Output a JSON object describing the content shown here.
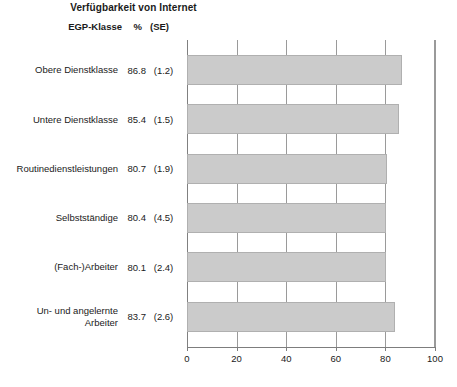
{
  "chart_data": {
    "type": "bar",
    "orientation": "horizontal",
    "title": "Verfügbarkeit von Internet",
    "xlabel": "",
    "ylabel": "",
    "xlim": [
      0,
      100
    ],
    "xticks": [
      0,
      20,
      40,
      60,
      80,
      100
    ],
    "grid": true,
    "legend": false,
    "bar_color": "#cbcbcb",
    "bar_border_color": "#b0b0b0",
    "columns": {
      "category": "EGP-Klasse",
      "percent": "%",
      "stderr": "(SE)"
    },
    "categories": [
      "Obere Dienstklasse",
      "Untere Dienstklasse",
      "Routinedienstleistungen",
      "Selbstständige",
      "(Fach-)Arbeiter",
      "Un- und angelernte\nArbeiter"
    ],
    "values": [
      86.8,
      85.4,
      80.7,
      80.4,
      80.1,
      83.7
    ],
    "standard_errors": [
      1.2,
      1.5,
      1.9,
      4.5,
      2.4,
      2.6
    ],
    "rows": [
      {
        "label": "Obere Dienstklasse",
        "percent": "86.8",
        "se": "(1.2)",
        "value": 86.8
      },
      {
        "label": "Untere Dienstklasse",
        "percent": "85.4",
        "se": "(1.5)",
        "value": 85.4
      },
      {
        "label": "Routinedienstleistungen",
        "percent": "80.7",
        "se": "(1.9)",
        "value": 80.7
      },
      {
        "label": "Selbstständige",
        "percent": "80.4",
        "se": "(4.5)",
        "value": 80.4
      },
      {
        "label": "(Fach-)Arbeiter",
        "percent": "80.1",
        "se": "(2.4)",
        "value": 80.1
      },
      {
        "label": "Un- und angelernte\nArbeiter",
        "percent": "83.7",
        "se": "(2.6)",
        "value": 83.7
      }
    ],
    "xticklabels": [
      "0",
      "20",
      "40",
      "60",
      "80",
      "100"
    ]
  }
}
